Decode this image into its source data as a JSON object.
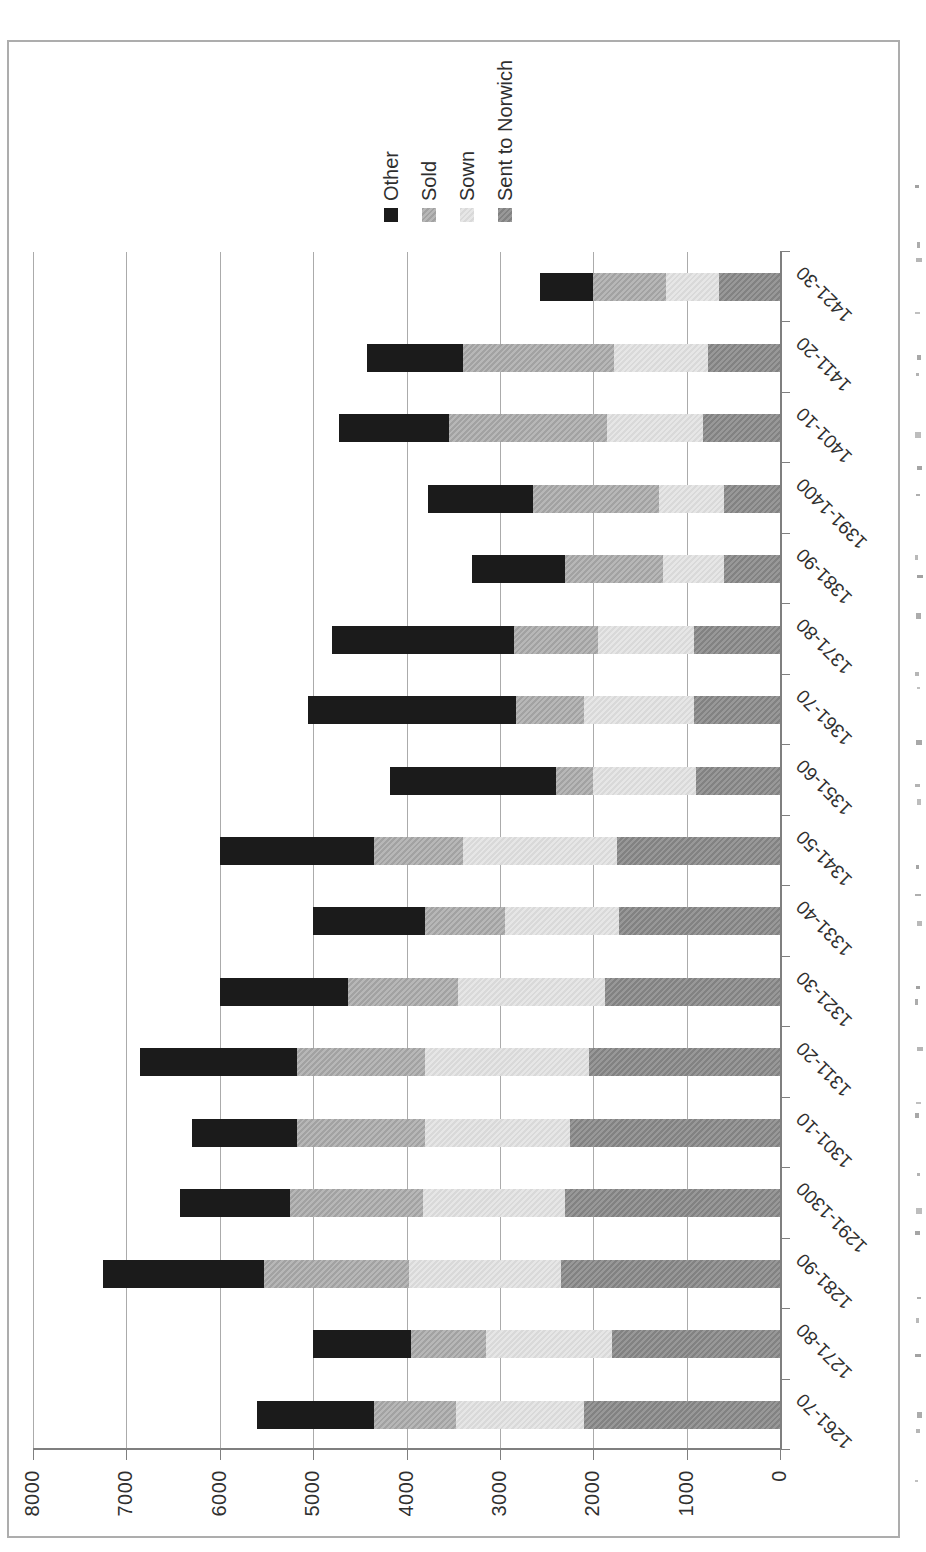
{
  "chart_data": {
    "type": "bar",
    "stacked": true,
    "title": "",
    "xlabel": "",
    "ylabel": "",
    "categories": [
      "1261-70",
      "1271-80",
      "1281-90",
      "1291-1300",
      "1301-10",
      "1311-20",
      "1321-30",
      "1331-40",
      "1341-50",
      "1351-60",
      "1361-70",
      "1371-80",
      "1381-90",
      "1391-1400",
      "1401-10",
      "1411-20",
      "1421-30"
    ],
    "series": [
      {
        "name": "Sent to Norwich",
        "color": "#8c8c8c",
        "values": [
          2100,
          1800,
          2350,
          2300,
          2250,
          2050,
          1875,
          1725,
          1750,
          900,
          925,
          925,
          600,
          600,
          825,
          775,
          650
        ]
      },
      {
        "name": "Sown",
        "color": "#e0e0e0",
        "values": [
          1375,
          1350,
          1625,
          1525,
          1550,
          1750,
          1575,
          1225,
          1650,
          1100,
          1175,
          1025,
          650,
          700,
          1025,
          1000,
          575
        ]
      },
      {
        "name": "Sold",
        "color": "#a9a9a9",
        "values": [
          875,
          800,
          1550,
          1425,
          1375,
          1375,
          1175,
          850,
          950,
          400,
          725,
          900,
          1050,
          1350,
          1700,
          1625,
          775
        ]
      },
      {
        "name": "Other",
        "color": "#1b1b1b",
        "values": [
          1250,
          1050,
          1725,
          1175,
          1125,
          1675,
          1375,
          1200,
          1650,
          1775,
          2225,
          1950,
          1000,
          1125,
          1175,
          1025,
          575
        ]
      }
    ],
    "stack_order_bottom_to_top": [
      "Sent to Norwich",
      "Sown",
      "Sold",
      "Other"
    ],
    "legend": {
      "position": "right",
      "entries": [
        "Other",
        "Sold",
        "Sown",
        "Sent to Norwich"
      ]
    },
    "ylim": [
      0,
      8000
    ],
    "yticks": [
      0,
      1000,
      2000,
      3000,
      4000,
      5000,
      6000,
      7000,
      8000
    ],
    "grid": "value gridlines at 1000 intervals",
    "orientation": "figure rotated 90 degrees counterclockwise on the page",
    "axis_color": "#7f7f7f",
    "gridline_color": "#ababab",
    "border_color": "#adadad",
    "text_color": "#2f2f2f"
  }
}
